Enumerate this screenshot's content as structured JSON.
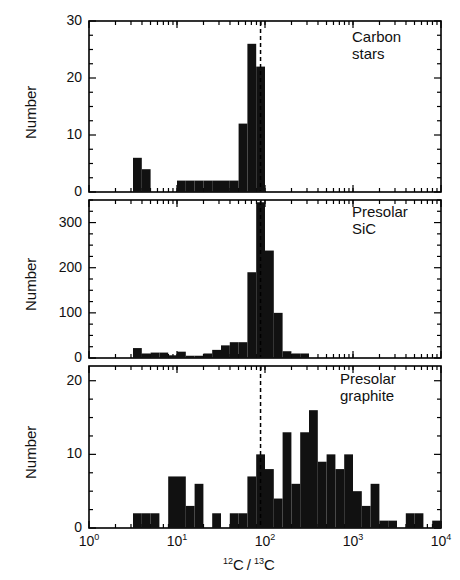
{
  "figure": {
    "xaxis": {
      "label_html": "12C / 13C",
      "label_plain": "12C/13C",
      "scale": "log",
      "min": 1,
      "max": 10000,
      "tick_labels": [
        "10⁰",
        "10¹",
        "10²",
        "10³",
        "10⁴"
      ],
      "tick_values": [
        1,
        10,
        100,
        1000,
        10000
      ],
      "tick_exponents": [
        "0",
        "1",
        "2",
        "3",
        "4"
      ]
    },
    "reference_line": {
      "name": "solar-ratio-dashed-line",
      "value": 89,
      "style": "dashed",
      "color": "#000000"
    },
    "panels": [
      {
        "id": "carbon-stars",
        "label": "Carbon\nstars",
        "label_line1": "Carbon",
        "label_line2": "stars",
        "ylabel": "Number",
        "ylim": [
          0,
          30
        ],
        "yticks": [
          0,
          10,
          20,
          30
        ],
        "ytick_labels": [
          "0",
          "10",
          "20",
          "30"
        ],
        "yminor_step": 2.5
      },
      {
        "id": "presolar-sic",
        "label": "Presolar\nSiC",
        "label_line1": "Presolar",
        "label_line2": "SiC",
        "ylabel": "Number",
        "ylim": [
          0,
          350
        ],
        "yticks": [
          0,
          100,
          200,
          300
        ],
        "ytick_labels": [
          "0",
          "100",
          "200",
          "300"
        ],
        "yminor_step": 25
      },
      {
        "id": "presolar-graphite",
        "label": "Presolar\ngraphite",
        "label_line1": "Presolar",
        "label_line2": "graphite",
        "ylabel": "Number",
        "ylim": [
          0,
          22
        ],
        "yticks": [
          0,
          10,
          20
        ],
        "ytick_labels": [
          "0",
          "10",
          "20"
        ],
        "yminor_step": 2.5
      }
    ]
  },
  "chart_data": [
    {
      "type": "bar",
      "id": "carbon-stars",
      "title": "Carbon stars",
      "xlabel": "12C/13C",
      "ylabel": "Number",
      "xscale": "log",
      "xlim": [
        1,
        10000
      ],
      "ylim": [
        0,
        30
      ],
      "bin_edges_log10": [
        0.5,
        0.6,
        0.7,
        1.0,
        1.1,
        1.2,
        1.3,
        1.4,
        1.5,
        1.6,
        1.7,
        1.8,
        1.9,
        2.0
      ],
      "bin_edges": [
        3.16,
        3.98,
        5.01,
        10.0,
        12.6,
        15.8,
        20.0,
        25.1,
        31.6,
        39.8,
        50.1,
        63.1,
        79.4,
        100.0
      ],
      "values": [
        6,
        4,
        0,
        2,
        2,
        2,
        2,
        2,
        2,
        2,
        12,
        26,
        22,
        7
      ],
      "grid": false
    },
    {
      "type": "bar",
      "id": "presolar-sic",
      "title": "Presolar SiC",
      "xlabel": "12C/13C",
      "ylabel": "Number",
      "xscale": "log",
      "xlim": [
        1,
        10000
      ],
      "ylim": [
        0,
        350
      ],
      "bin_edges_log10": [
        0.5,
        0.6,
        0.7,
        0.8,
        0.9,
        1.0,
        1.1,
        1.2,
        1.3,
        1.4,
        1.5,
        1.6,
        1.7,
        1.8,
        1.9,
        2.0,
        2.1,
        2.2,
        2.3,
        2.4,
        2.5
      ],
      "bin_edges": [
        3.16,
        3.98,
        5.01,
        6.31,
        7.94,
        10.0,
        12.6,
        15.8,
        20.0,
        25.1,
        31.6,
        39.8,
        50.1,
        63.1,
        79.4,
        100.0,
        125.9,
        158.5,
        199.5,
        251.2,
        316.2
      ],
      "values": [
        22,
        10,
        12,
        12,
        6,
        14,
        5,
        5,
        10,
        18,
        28,
        35,
        35,
        190,
        345,
        238,
        100,
        15,
        10,
        10,
        5
      ],
      "grid": false
    },
    {
      "type": "bar",
      "id": "presolar-graphite",
      "title": "Presolar graphite",
      "xlabel": "12C/13C",
      "ylabel": "Number",
      "xscale": "log",
      "xlim": [
        1,
        10000
      ],
      "ylim": [
        0,
        22
      ],
      "bin_edges_log10": [
        0.5,
        0.6,
        0.7,
        0.8,
        0.9,
        1.0,
        1.1,
        1.2,
        1.3,
        1.4,
        1.5,
        1.6,
        1.7,
        1.8,
        1.9,
        2.0,
        2.1,
        2.2,
        2.3,
        2.4,
        2.5,
        2.6,
        2.7,
        2.8,
        2.9,
        3.0,
        3.1,
        3.2,
        3.3,
        3.4,
        3.5,
        3.6,
        3.7,
        3.8,
        3.9,
        4.0
      ],
      "bin_edges": [
        3.16,
        3.98,
        5.01,
        6.31,
        7.94,
        10.0,
        12.6,
        15.8,
        20.0,
        25.1,
        31.6,
        39.8,
        50.1,
        63.1,
        79.4,
        100.0,
        125.9,
        158.5,
        199.5,
        251.2,
        316.2,
        398.1,
        501.2,
        631.0,
        794.3,
        1000.0,
        1258.9,
        1584.9,
        1995.3,
        2511.9,
        3162.3,
        3981.1,
        5011.9,
        6309.6,
        7943.3,
        10000.0
      ],
      "values": [
        2,
        2,
        2,
        0,
        7,
        7,
        3,
        6,
        0,
        2,
        0,
        2,
        2,
        7,
        10,
        8,
        4,
        13,
        6,
        13,
        16,
        9,
        10,
        8,
        10,
        5,
        3,
        6,
        1,
        1,
        0,
        2,
        2,
        0,
        1,
        0
      ],
      "grid": false
    }
  ]
}
